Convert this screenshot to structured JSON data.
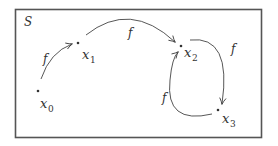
{
  "diagram": {
    "set_label": "S",
    "colors": {
      "stroke": "#444444",
      "border": "#555555",
      "text": "#333333",
      "background": "#ffffff"
    },
    "nodes": [
      {
        "id": "x0",
        "name": "x",
        "subscript": "0"
      },
      {
        "id": "x1",
        "name": "x",
        "subscript": "1"
      },
      {
        "id": "x2",
        "name": "x",
        "subscript": "2"
      },
      {
        "id": "x3",
        "name": "x",
        "subscript": "3"
      }
    ],
    "edges": [
      {
        "from": "x0",
        "to": "x1",
        "label": "f"
      },
      {
        "from": "x1",
        "to": "x2",
        "label": "f"
      },
      {
        "from": "x2",
        "to": "x3",
        "label": "f"
      },
      {
        "from": "x3",
        "to": "x2",
        "label": "f"
      }
    ]
  }
}
